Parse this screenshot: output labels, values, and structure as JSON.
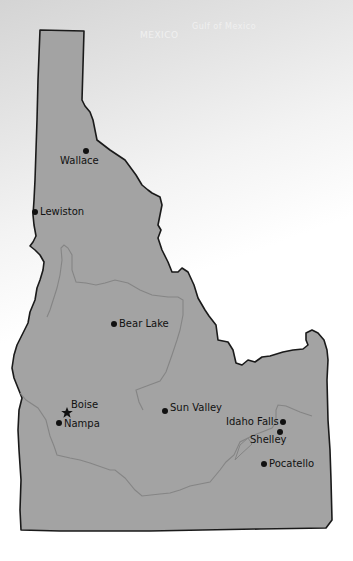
{
  "map": {
    "region": "Idaho",
    "background_labels": [
      "MEXICO",
      "Gulf of Mexico"
    ],
    "colors": {
      "state_fill": "#a3a3a3",
      "state_border": "#1a1a1a",
      "river": "#858585",
      "marker": "#111111"
    },
    "cities": [
      {
        "name": "Wallace",
        "type": "city",
        "dot": [
          86,
          151
        ],
        "label": [
          60,
          155
        ]
      },
      {
        "name": "Lewiston",
        "type": "city",
        "dot": [
          35,
          212
        ],
        "label": [
          40,
          206
        ]
      },
      {
        "name": "Bear Lake",
        "type": "city",
        "dot": [
          114,
          324
        ],
        "label": [
          119,
          318
        ]
      },
      {
        "name": "Boise",
        "type": "capital",
        "dot": [
          67,
          413
        ],
        "label": [
          71,
          399
        ]
      },
      {
        "name": "Nampa",
        "type": "city",
        "dot": [
          59,
          423
        ],
        "label": [
          64,
          418
        ]
      },
      {
        "name": "Sun Valley",
        "type": "city",
        "dot": [
          165,
          411
        ],
        "label": [
          170,
          402
        ]
      },
      {
        "name": "Idaho Falls",
        "type": "city",
        "dot": [
          283,
          422
        ],
        "label": [
          226,
          416
        ]
      },
      {
        "name": "Shelley",
        "type": "city",
        "dot": [
          280,
          432
        ],
        "label": [
          250,
          434
        ]
      },
      {
        "name": "Pocatello",
        "type": "city",
        "dot": [
          264,
          464
        ],
        "label": [
          269,
          458
        ]
      }
    ]
  }
}
